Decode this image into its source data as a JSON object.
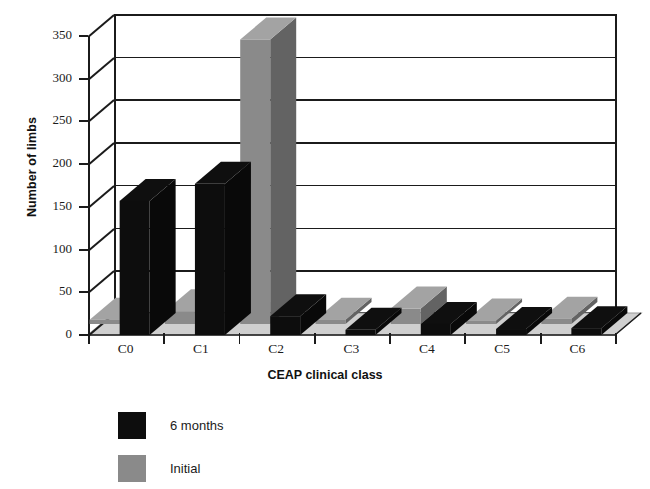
{
  "chart_data": {
    "type": "bar",
    "title": "",
    "xlabel": "CEAP clinical class",
    "ylabel": "Number of limbs",
    "categories": [
      "C0",
      "C1",
      "C2",
      "C3",
      "C4",
      "C5",
      "C6"
    ],
    "series": [
      {
        "name": "Initial",
        "color": "#8a8a8a",
        "values": [
          5,
          15,
          333,
          5,
          18,
          4,
          6
        ]
      },
      {
        "name": "6 months",
        "color": "#0d0d0d",
        "values": [
          157,
          177,
          22,
          6,
          13,
          7,
          8
        ]
      }
    ],
    "ylim": [
      0,
      350
    ],
    "yticks": [
      0,
      50,
      100,
      150,
      200,
      250,
      300,
      350
    ],
    "ytick_labels": [
      "0",
      "50",
      "100",
      "150",
      "200",
      "250",
      "300",
      "350"
    ],
    "grid": true,
    "legend_position": "below-left",
    "style": "3d-column"
  },
  "legend": {
    "entries": [
      {
        "label": "6 months",
        "color": "#0d0d0d"
      },
      {
        "label": "Initial",
        "color": "#8a8a8a"
      }
    ]
  },
  "caption": {
    "text": ""
  },
  "colors": {
    "black_bar": "#0d0d0d",
    "gray_bar": "#8a8a8a",
    "floor": "#cfcfcf",
    "axis": "#1b1b1b",
    "background": "#ffffff"
  }
}
